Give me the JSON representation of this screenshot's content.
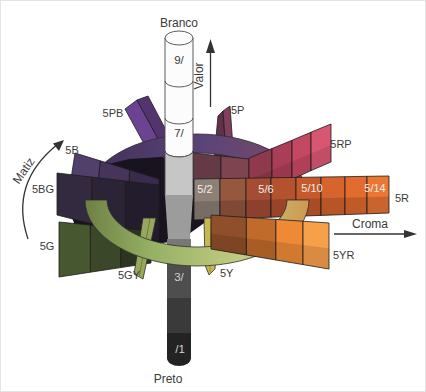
{
  "labels": {
    "white": "Branco",
    "black": "Preto",
    "value_axis": "Valor",
    "hue_axis": "Matiz",
    "chroma_axis": "Croma"
  },
  "value_levels": {
    "v9": "9/",
    "v7": "7/",
    "v3": "3/",
    "v1": "/1"
  },
  "chroma_levels": {
    "c2": "5/2",
    "c6": "5/6",
    "c10": "5/10",
    "c14": "5/14"
  },
  "hues": {
    "r": {
      "label": "5R",
      "cells": [
        "#8d8177",
        "#96573f",
        "#a44d33",
        "#b4512f",
        "#c65a2d",
        "#d6642c",
        "#e26c2e",
        "#ec7634"
      ]
    },
    "yr": {
      "label": "5YR",
      "cells": [
        "#8f4f2a",
        "#c06a2b",
        "#ee8a35",
        "#f7a04a"
      ]
    },
    "y": {
      "label": "5Y",
      "cells": [
        "#c4b84e"
      ]
    },
    "gy": {
      "label": "5GY",
      "cells": [
        "#97a85c"
      ]
    },
    "g": {
      "label": "5G",
      "cells": [
        "#2c3520",
        "#3a4728",
        "#475730"
      ]
    },
    "bg": {
      "label": "5BG",
      "cells": [
        "#231c2c",
        "#2b2336",
        "#332a40"
      ]
    },
    "b": {
      "label": "5B",
      "cells": [
        "#3a2b4e",
        "#46345c",
        "#52406c"
      ]
    },
    "pb": {
      "label": "5PB",
      "cells": [
        "#6b4392",
        "#53346e"
      ]
    },
    "p": {
      "label": "5P",
      "cells": [
        "#62304a",
        "#7f3f5d"
      ]
    },
    "rp": {
      "label": "5RP",
      "cells": [
        "#8e3a4c",
        "#aa3e56",
        "#c44862",
        "#d75672"
      ]
    },
    "rp_inner": {
      "cells": [
        "#643a46",
        "#7e4450"
      ]
    }
  },
  "ring": {
    "upper_start": "#3f2f58",
    "upper_mid": "#5c4578",
    "upper_end": "#7d4a62",
    "lower_start": "#6e8044",
    "lower_mid1": "#96b164",
    "lower_mid2": "#c2cc82",
    "lower_end": "#cf9850"
  },
  "cylinder": {
    "white": "#fcfcfc",
    "light": "#c6c6c6",
    "taper": "#9c9c9c",
    "shaft": "#787878",
    "dark": "#4e4e4e",
    "darker": "#3a3a3a",
    "black": "#232323"
  },
  "hub": "#18131e",
  "ink": "#3a3a3a",
  "background": "#ffffff"
}
